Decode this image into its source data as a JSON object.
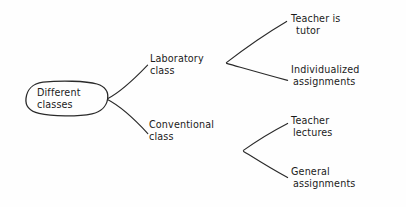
{
  "diagram": {
    "type": "tree",
    "style": "hand-drawn sketch",
    "background_color": "#fefefe",
    "ink_color": "#2a2a2a",
    "orientation": "left-to-right",
    "root": {
      "id": "root",
      "label_line1": "Different",
      "label_line2": "classes",
      "shape": "rounded-oval",
      "x": 66,
      "y": 99
    },
    "branches": [
      {
        "id": "laboratory-class",
        "label_line1": "Laboratory",
        "label_line2": "class",
        "x": 148,
        "y": 62,
        "children": [
          {
            "id": "teacher-is-tutor",
            "label_line1": "Teacher is",
            "label_line2": "tutor",
            "x": 290,
            "y": 22
          },
          {
            "id": "individualized-assignments",
            "label_line1": "Individualized",
            "label_line2": "assignments",
            "x": 290,
            "y": 73
          }
        ]
      },
      {
        "id": "conventional-class",
        "label_line1": "Conventional",
        "label_line2": "class",
        "x": 148,
        "y": 128,
        "children": [
          {
            "id": "teacher-lectures",
            "label_line1": "Teacher",
            "label_line2": "lectures",
            "x": 290,
            "y": 124
          },
          {
            "id": "general-assignments",
            "label_line1": "General",
            "label_line2": "assignments",
            "x": 290,
            "y": 175
          }
        ]
      }
    ],
    "edges": [
      {
        "id": "edge-root-to-laboratory",
        "from": "root",
        "to": "laboratory-class",
        "path": "M107.5,98.5 L147.5,64.5"
      },
      {
        "id": "edge-root-to-conventional",
        "from": "root",
        "to": "conventional-class",
        "path": "M107.5,99.5 L147.5,133.5"
      },
      {
        "id": "edge-laboratory-to-teacher-tutor",
        "from": "laboratory-class",
        "to": "teacher-is-tutor",
        "path": "M226.5,62.5 L286.5,21.5"
      },
      {
        "id": "edge-laboratory-to-individualized",
        "from": "laboratory-class",
        "to": "individualized-assignments",
        "path": "M226.5,63.5 L287.5,80.5"
      },
      {
        "id": "edge-conventional-to-teacher-lectures",
        "from": "conventional-class",
        "to": "teacher-lectures",
        "path": "M243.5,150.5 L287.5,123.5"
      },
      {
        "id": "edge-conventional-to-general",
        "from": "conventional-class",
        "to": "general-assignments",
        "path": "M243.5,151.5 L287.5,177.5"
      }
    ]
  }
}
